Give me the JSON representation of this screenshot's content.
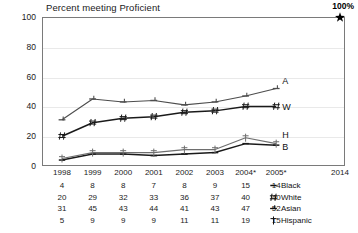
{
  "chart_data": {
    "type": "line",
    "title": "Percent meeting Proficient",
    "xlabel": "",
    "ylabel": "",
    "ylim": [
      0,
      100
    ],
    "yticks": [
      0,
      20,
      40,
      60,
      80,
      100
    ],
    "grid": true,
    "legend_position": "bottom-right",
    "categories": [
      "1998",
      "1999",
      "2000",
      "2001",
      "2002",
      "2003",
      "2004*",
      "2005*"
    ],
    "target_year": "2014",
    "target_label": "100%",
    "target_value": 100,
    "target_marker": "star",
    "series": [
      {
        "name": "Black",
        "short": "B",
        "marker": "dash",
        "color": "#1a1a1a",
        "values": [
          4,
          8,
          8,
          7,
          8,
          9,
          15,
          14
        ]
      },
      {
        "name": "White",
        "short": "W",
        "marker": "hash",
        "color": "#1a1a1a",
        "values": [
          20,
          29,
          32,
          33,
          36,
          37,
          40,
          40
        ]
      },
      {
        "name": "Asian",
        "short": "A",
        "marker": "dash-tick",
        "color": "#4d4d4d",
        "values": [
          31,
          45,
          43,
          44,
          41,
          43,
          47,
          52
        ]
      },
      {
        "name": "Hispanic",
        "short": "H",
        "marker": "dagger",
        "color": "#6e6e6e",
        "values": [
          5,
          9,
          9,
          9,
          11,
          11,
          19,
          15
        ]
      }
    ]
  },
  "legend": {
    "items": [
      {
        "label": "Black",
        "marker": "dash"
      },
      {
        "label": "White",
        "marker": "hash"
      },
      {
        "label": "Asian",
        "marker": "dash-tick"
      },
      {
        "label": "Hispanic",
        "marker": "dagger"
      }
    ]
  }
}
